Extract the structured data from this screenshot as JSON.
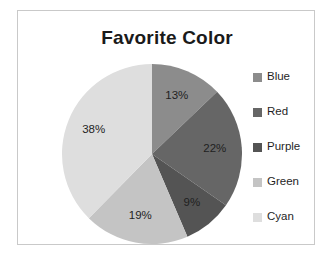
{
  "chart_data": {
    "type": "pie",
    "title": "Favorite Color",
    "xlabel": "",
    "ylabel": "",
    "legend_position": "right",
    "grid": false,
    "categories": [
      "Blue",
      "Red",
      "Purple",
      "Green",
      "Cyan"
    ],
    "values": [
      13,
      22,
      9,
      19,
      38
    ],
    "data_labels": [
      "13%",
      "22%",
      "9%",
      "19%",
      "38%"
    ],
    "start_angle_deg": 0,
    "direction": "clockwise",
    "slice_colors": [
      "#8c8c8c",
      "#666666",
      "#545454",
      "#c4c4c4",
      "#dedede"
    ],
    "slices": [
      {
        "label": "Blue",
        "value": 13,
        "data_label": "13%",
        "color": "#8c8c8c"
      },
      {
        "label": "Red",
        "value": 22,
        "data_label": "22%",
        "color": "#666666"
      },
      {
        "label": "Purple",
        "value": 9,
        "data_label": "9%",
        "color": "#545454"
      },
      {
        "label": "Green",
        "value": 19,
        "data_label": "19%",
        "color": "#c4c4c4"
      },
      {
        "label": "Cyan",
        "value": 38,
        "data_label": "38%",
        "color": "#dedede"
      }
    ]
  },
  "chart": {
    "title": "Favorite Color",
    "border_color": "#c9c9c9",
    "background": "#ffffff"
  },
  "legend": {
    "items": [
      {
        "label": "Blue",
        "color": "#8c8c8c"
      },
      {
        "label": "Red",
        "color": "#666666"
      },
      {
        "label": "Purple",
        "color": "#545454"
      },
      {
        "label": "Green",
        "color": "#c4c4c4"
      },
      {
        "label": "Cyan",
        "color": "#dedede"
      }
    ]
  }
}
